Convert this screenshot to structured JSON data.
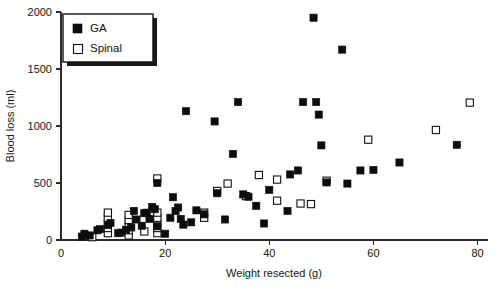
{
  "chart_data": {
    "type": "scatter",
    "title": "",
    "xlabel": "Weight resected (g)",
    "ylabel": "Blood loss (ml)",
    "xlim": [
      0,
      82
    ],
    "ylim": [
      0,
      2000
    ],
    "xticks": [
      0,
      20,
      40,
      60,
      80
    ],
    "yticks": [
      0,
      500,
      1000,
      1500,
      2000
    ],
    "xtick_labels": [
      "0",
      "20",
      "40",
      "60",
      "80"
    ],
    "ytick_labels": [
      "0",
      "500",
      "1000",
      "1500",
      "2000"
    ],
    "grid": false,
    "legend_position": "upper left",
    "series": [
      {
        "name": "GA",
        "marker": "filled-square",
        "color": "#0d0d0d",
        "points": [
          [
            4,
            30
          ],
          [
            4.5,
            55
          ],
          [
            5.5,
            40
          ],
          [
            7,
            85
          ],
          [
            7.5,
            95
          ],
          [
            9,
            130
          ],
          [
            9.5,
            150
          ],
          [
            11,
            60
          ],
          [
            11.5,
            65
          ],
          [
            12.5,
            90
          ],
          [
            13.5,
            110
          ],
          [
            14,
            255
          ],
          [
            14.5,
            180
          ],
          [
            15.5,
            125
          ],
          [
            16,
            235
          ],
          [
            16.5,
            240
          ],
          [
            17,
            185
          ],
          [
            17.5,
            290
          ],
          [
            18,
            270
          ],
          [
            18.5,
            120
          ],
          [
            18.5,
            500
          ],
          [
            20,
            55
          ],
          [
            21,
            195
          ],
          [
            21.5,
            375
          ],
          [
            22,
            255
          ],
          [
            22.5,
            285
          ],
          [
            23,
            185
          ],
          [
            23.5,
            135
          ],
          [
            24,
            1130
          ],
          [
            25,
            155
          ],
          [
            26,
            260
          ],
          [
            27.5,
            225
          ],
          [
            29.5,
            1040
          ],
          [
            30,
            410
          ],
          [
            31.5,
            180
          ],
          [
            33,
            755
          ],
          [
            34,
            1210
          ],
          [
            35,
            400
          ],
          [
            36,
            380
          ],
          [
            37.5,
            300
          ],
          [
            39,
            145
          ],
          [
            40,
            440
          ],
          [
            43.5,
            255
          ],
          [
            44,
            575
          ],
          [
            45.5,
            610
          ],
          [
            46.5,
            1210
          ],
          [
            48.5,
            1950
          ],
          [
            49,
            1210
          ],
          [
            49.5,
            1100
          ],
          [
            50,
            830
          ],
          [
            51,
            505
          ],
          [
            54,
            1670
          ],
          [
            55,
            495
          ],
          [
            57.5,
            610
          ],
          [
            60,
            615
          ],
          [
            65,
            680
          ],
          [
            76,
            835
          ]
        ]
      },
      {
        "name": "Spinal",
        "marker": "open-square",
        "color": "#ffffff",
        "points": [
          [
            6,
            25
          ],
          [
            9,
            60
          ],
          [
            9,
            105
          ],
          [
            9,
            150
          ],
          [
            9,
            195
          ],
          [
            9,
            240
          ],
          [
            13,
            40
          ],
          [
            13,
            85
          ],
          [
            13,
            130
          ],
          [
            13,
            175
          ],
          [
            13,
            220
          ],
          [
            16,
            75
          ],
          [
            18.5,
            60
          ],
          [
            18.5,
            105
          ],
          [
            18.5,
            150
          ],
          [
            18.5,
            195
          ],
          [
            18.5,
            240
          ],
          [
            18.5,
            540
          ],
          [
            27.5,
            195
          ],
          [
            27.5,
            240
          ],
          [
            30,
            430
          ],
          [
            32,
            495
          ],
          [
            35.5,
            385
          ],
          [
            38,
            570
          ],
          [
            41.5,
            345
          ],
          [
            41.5,
            530
          ],
          [
            46,
            320
          ],
          [
            48,
            315
          ],
          [
            51,
            520
          ],
          [
            59,
            880
          ],
          [
            72,
            965
          ],
          [
            78.5,
            1205
          ]
        ]
      }
    ]
  },
  "legend": {
    "entries": [
      {
        "label": "GA",
        "marker": "filled-square"
      },
      {
        "label": "Spinal",
        "marker": "open-square"
      }
    ]
  }
}
